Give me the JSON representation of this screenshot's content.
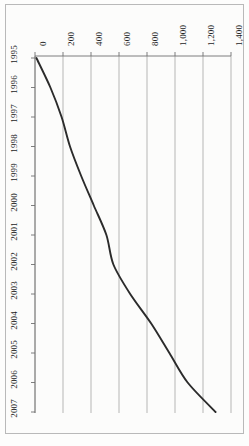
{
  "chart_data": {
    "type": "line",
    "title": "",
    "subtitle": "",
    "xlabel": "",
    "ylabel": "",
    "orientation": "rotated-90",
    "grid": true,
    "legend": null,
    "xlim": [
      0,
      1400
    ],
    "x_ticks": [
      "0",
      "200",
      "400",
      "600",
      "800",
      "1,000",
      "1,200",
      "1,400"
    ],
    "x_tick_values": [
      0,
      200,
      400,
      600,
      800,
      1000,
      1200,
      1400
    ],
    "categories": [
      "1995",
      "1996",
      "1997",
      "1998",
      "1999",
      "2000",
      "2001",
      "2002",
      "2003",
      "2004",
      "2005",
      "2006",
      "2007"
    ],
    "series": [
      {
        "name": "series-1",
        "color": "#2b2b2b",
        "values": [
          10,
          110,
          190,
          250,
          330,
          420,
          510,
          560,
          680,
          830,
          960,
          1090,
          1290
        ]
      }
    ]
  },
  "axes": {
    "value_axis_name": "value-axis",
    "category_axis_name": "year-axis"
  }
}
